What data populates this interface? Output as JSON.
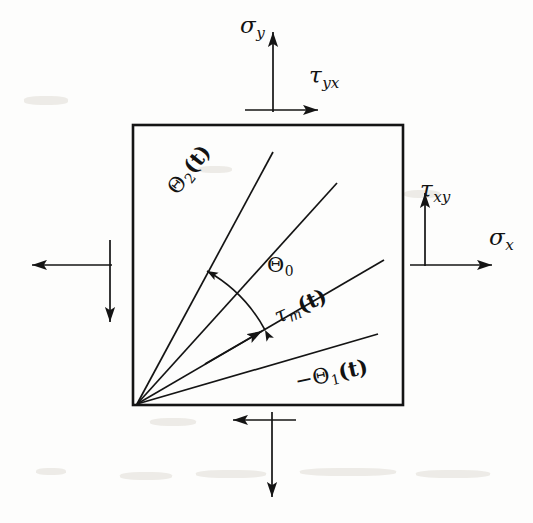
{
  "figure": {
    "background_color": "#fdfdfc",
    "ink_color": "#141414",
    "element": {
      "shape": "square",
      "x": 133,
      "y": 125,
      "width": 270,
      "height": 280,
      "stroke_width": 2.6
    },
    "labels": {
      "sigma_y": {
        "symbol": "σ",
        "subscript": "y",
        "name": "normal-stress-y"
      },
      "tau_yx": {
        "symbol": "τ",
        "subscript": "yx",
        "name": "shear-stress-yx"
      },
      "tau_xy": {
        "symbol": "τ",
        "subscript": "xy",
        "name": "shear-stress-xy"
      },
      "sigma_x": {
        "symbol": "σ",
        "subscript": "x",
        "name": "normal-stress-x"
      },
      "theta_0": {
        "symbol": "Θ",
        "subscript": "0",
        "suffix": "",
        "name": "angle-theta-zero"
      },
      "theta_2": {
        "symbol": "Θ",
        "subscript": "2",
        "suffix": "(t)",
        "name": "angle-theta-two"
      },
      "tau_m": {
        "symbol": "τ",
        "subscript": "m",
        "suffix": "(t)",
        "name": "max-shear-plane"
      },
      "theta_1": {
        "prefix": "−",
        "symbol": "Θ",
        "subscript": "1",
        "suffix": "(t)",
        "name": "angle-theta-one"
      }
    },
    "rays": [
      {
        "name": "theta-2-ray",
        "x1": 137,
        "y1": 404,
        "x2": 273,
        "y2": 152,
        "angle_deg": 61.6
      },
      {
        "name": "theta-0-ray",
        "x1": 137,
        "y1": 404,
        "x2": 337,
        "y2": 183,
        "angle_deg": 47.8
      },
      {
        "name": "tau-m-ray",
        "x1": 137,
        "y1": 404,
        "x2": 384,
        "y2": 260,
        "angle_deg": 30.2,
        "arrowhead": true
      },
      {
        "name": "theta-1-ray",
        "x1": 137,
        "y1": 404,
        "x2": 378,
        "y2": 334,
        "angle_deg": 16.2
      }
    ],
    "arc": {
      "name": "theta-0-arc",
      "center_x": 137,
      "center_y": 404,
      "radius": 148,
      "start_angle_deg": 30.2,
      "end_angle_deg": 61.6,
      "double_headed": true
    },
    "stress_arrows": [
      {
        "name": "sigma-y-arrow",
        "x1": 273,
        "y1": 110,
        "x2": 273,
        "y2": 30,
        "direction": "up"
      },
      {
        "name": "tau-yx-arrow",
        "x1": 245,
        "y1": 110,
        "x2": 318,
        "y2": 110,
        "direction": "right"
      },
      {
        "name": "tau-xy-arrow",
        "x1": 425,
        "y1": 265,
        "x2": 425,
        "y2": 192,
        "direction": "up"
      },
      {
        "name": "sigma-x-arrow",
        "x1": 410,
        "y1": 265,
        "x2": 492,
        "y2": 265,
        "direction": "right"
      },
      {
        "name": "sigma-x-left-arrow",
        "x1": 110,
        "y1": 265,
        "x2": 30,
        "y2": 265,
        "direction": "left"
      },
      {
        "name": "tau-xy-left-arrow",
        "x1": 110,
        "y1": 240,
        "x2": 110,
        "y2": 320,
        "direction": "down"
      },
      {
        "name": "tau-yx-bottom-arrow",
        "x1": 295,
        "y1": 420,
        "x2": 233,
        "y2": 420,
        "direction": "left"
      },
      {
        "name": "sigma-y-bottom-arrow",
        "x1": 272,
        "y1": 412,
        "x2": 272,
        "y2": 497,
        "direction": "down"
      }
    ]
  }
}
